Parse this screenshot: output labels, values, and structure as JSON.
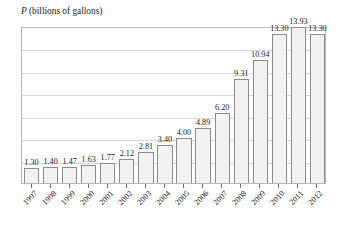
{
  "chart": {
    "axis_title_variable": "P",
    "axis_title_rest": " (billions of gallons)"
  },
  "chart_data": {
    "type": "bar",
    "title": "P (billions of gallons)",
    "xlabel": "",
    "ylabel": "P (billions of gallons)",
    "ylim": [
      0,
      14
    ],
    "grid": true,
    "gridlines": [
      2,
      4,
      6,
      8,
      10,
      12
    ],
    "legend": null,
    "categories": [
      "1997",
      "1998",
      "1999",
      "2000",
      "2001",
      "2002",
      "2003",
      "2004",
      "2005",
      "2006",
      "2007",
      "2008",
      "2009",
      "2010",
      "2011",
      "2012"
    ],
    "values": [
      1.3,
      1.4,
      1.47,
      1.63,
      1.77,
      2.12,
      2.81,
      3.4,
      4.0,
      4.89,
      6.2,
      9.31,
      10.94,
      13.3,
      13.93,
      13.3
    ],
    "data_labels": [
      "1.30",
      "1.40",
      "1.47",
      "1.63",
      "1.77",
      "2.12",
      "2.81",
      "3.40",
      "4.00",
      "4.89",
      "6.20",
      "9.31",
      "10.94",
      "13.30",
      "13.93",
      "13.30"
    ],
    "colors": {
      "bar_fill": "#f2f2f2",
      "bar_stroke": "#8c8c8c",
      "gridline": "#d8d8d8",
      "frame": "#b9b9b9",
      "text": "#1a1a1a"
    }
  }
}
